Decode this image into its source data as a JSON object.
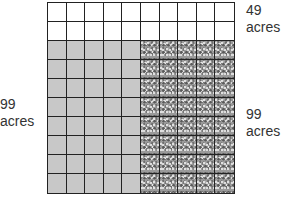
{
  "diagram": {
    "grid": {
      "rows": 10,
      "cols": 10,
      "white_rows": 2,
      "gray_cols": 5,
      "speckled_cols": 5
    },
    "colors": {
      "white": "#ffffff",
      "gray": "#c8c8c8",
      "speckled": "#9a9a9a",
      "lines": "#222222"
    }
  },
  "labels": {
    "top_right": {
      "value": "49",
      "unit": "acres"
    },
    "left": {
      "value": "99",
      "unit": "acres"
    },
    "right": {
      "value": "99",
      "unit": "acres"
    }
  }
}
